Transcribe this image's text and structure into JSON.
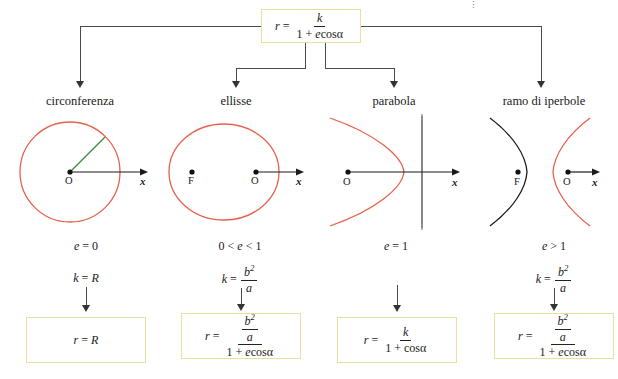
{
  "diagram": {
    "title_formula": {
      "lhs": "r",
      "eq": "=",
      "numerator": "k",
      "denominator": "1 + e cos α",
      "plain": "r = k / (1 + e cos α)"
    },
    "columns": [
      {
        "id": "circonferenza",
        "label": "circonferenza",
        "eccentricity": "e = 0",
        "k_value": "k = R",
        "k_numerator": "",
        "k_denominator": "",
        "result_plain": "r = R",
        "result_numerator": "",
        "result_denominator": "",
        "figure": {
          "type": "circle",
          "origin_label": "O",
          "focus_label": "",
          "axis_label": "x",
          "curve_color": "#e8604c",
          "radius_color": "#3a8a3a",
          "has_radius_segment": true,
          "has_directrix": false
        }
      },
      {
        "id": "ellisse",
        "label": "ellisse",
        "eccentricity": "0 < e < 1",
        "k_value": "k = b²/a",
        "k_numerator": "b²",
        "k_denominator": "a",
        "result_plain": "",
        "result_numerator": "b²/a",
        "result_denominator": "1 + e cos α",
        "figure": {
          "type": "ellipse",
          "origin_label": "O",
          "focus_label": "F",
          "axis_label": "x",
          "curve_color": "#e8604c",
          "radius_color": "",
          "has_radius_segment": false,
          "has_directrix": false
        }
      },
      {
        "id": "parabola",
        "label": "parabola",
        "eccentricity": "e = 1",
        "k_value": "",
        "k_numerator": "",
        "k_denominator": "",
        "result_plain": "",
        "result_numerator": "k",
        "result_denominator": "1 + cos α",
        "figure": {
          "type": "parabola",
          "origin_label": "O",
          "focus_label": "",
          "axis_label": "x",
          "curve_color": "#e8604c",
          "radius_color": "",
          "has_radius_segment": false,
          "has_directrix": true
        }
      },
      {
        "id": "ramo-di-iperbole",
        "label": "ramo di iperbole",
        "eccentricity": "e > 1",
        "k_value": "k = b²/a",
        "k_numerator": "b²",
        "k_denominator": "a",
        "result_plain": "",
        "result_numerator": "b²/a",
        "result_denominator": "1 + e cos α",
        "figure": {
          "type": "hyperbola",
          "origin_label": "O",
          "focus_label": "F",
          "axis_label": "x",
          "curve_color": "#e8604c",
          "second_branch_color": "#1a1a1a",
          "radius_color": "",
          "has_radius_segment": false,
          "has_directrix": false
        }
      }
    ],
    "symbols": {
      "r": "r",
      "k": "k",
      "b": "b",
      "a": "a",
      "R": "R",
      "one": "1",
      "plus": "+",
      "e": "e",
      "cos": "cos",
      "alpha": "α",
      "equals": "=",
      "exp2": "2"
    },
    "colors": {
      "box_border": "#eadfa0",
      "curve": "#e8604c",
      "radius": "#3a8a3a",
      "axis": "#1a1a1a",
      "connector": "#4a4a4a",
      "hyperbola_branch": "#1a1a1a",
      "directrix": "#555555"
    }
  }
}
